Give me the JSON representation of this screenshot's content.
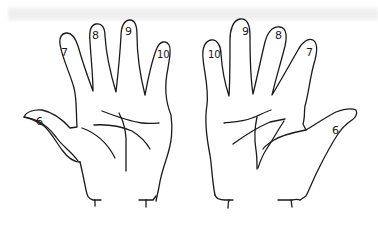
{
  "figure": {
    "background_color": "#ffffff",
    "stroke_color": "#1a1a1a",
    "band_color": "#ececec"
  },
  "hands": [
    {
      "side": "left",
      "fingers": [
        {
          "name": "thumb",
          "label": "6",
          "x": 38,
          "y": 121
        },
        {
          "name": "index",
          "label": "7",
          "x": 61,
          "y": 52
        },
        {
          "name": "middle",
          "label": "8",
          "x": 92,
          "y": 35
        },
        {
          "name": "ring",
          "label": "9",
          "x": 125,
          "y": 31
        },
        {
          "name": "little",
          "label": "10",
          "x": 158,
          "y": 56
        }
      ]
    },
    {
      "side": "right",
      "fingers": [
        {
          "name": "little",
          "label": "10",
          "x": 210,
          "y": 56
        },
        {
          "name": "ring",
          "label": "9",
          "x": 242,
          "y": 31
        },
        {
          "name": "middle",
          "label": "8",
          "x": 276,
          "y": 35
        },
        {
          "name": "index",
          "label": "7",
          "x": 306,
          "y": 52
        },
        {
          "name": "thumb",
          "label": "6",
          "x": 333,
          "y": 130
        }
      ]
    }
  ]
}
